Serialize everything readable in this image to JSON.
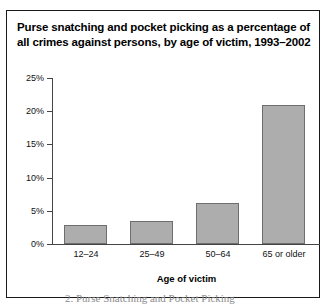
{
  "figure": {
    "title": "Purse snatching and pocket picking as a percentage of all crimes against persons, by age of victim, 1993–2002",
    "bar_fill_color": "#adadad",
    "bar_border_color": "#6e6e6e",
    "axis_color": "#444444",
    "frame_color": "#1a1a1a"
  },
  "bleed_text": "2. Purse Snatching and Pocket Picking",
  "chart_data": {
    "type": "bar",
    "title": "Purse snatching and pocket picking as a percentage of all crimes against persons, by age of victim, 1993–2002",
    "xlabel": "Age of victim",
    "ylabel": "",
    "categories": [
      "12–24",
      "25–49",
      "50–64",
      "65 or older"
    ],
    "values": [
      2.9,
      3.5,
      6.2,
      21.0
    ],
    "ylim": [
      0,
      25
    ],
    "yticks": [
      0,
      5,
      10,
      15,
      20,
      25
    ],
    "ytick_labels": [
      "0%",
      "5%",
      "10%",
      "15%",
      "20%",
      "25%"
    ],
    "grid": false,
    "legend": null
  }
}
